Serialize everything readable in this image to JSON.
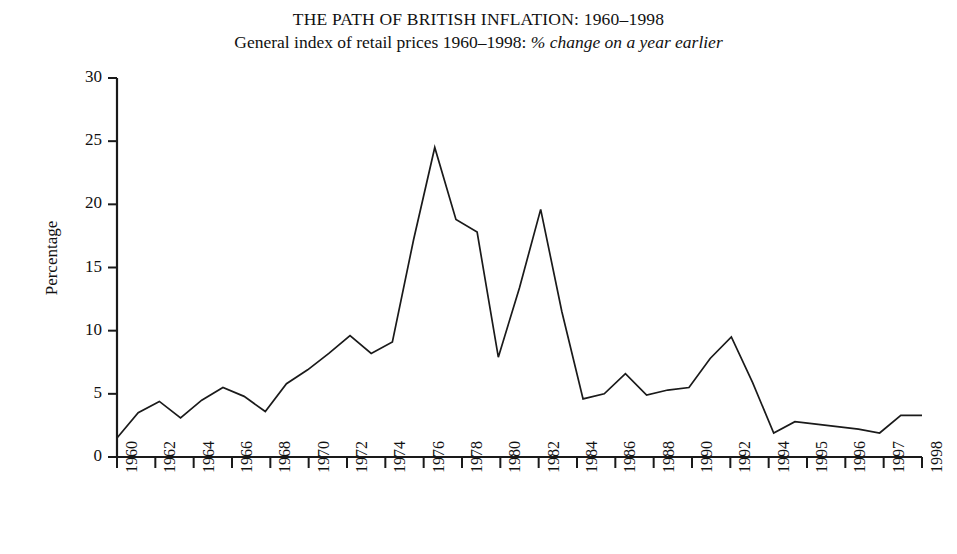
{
  "chart_data": {
    "type": "line",
    "title": "THE PATH OF BRITISH INFLATION: 1960–1998",
    "subtitle_plain": "General index of retail prices 1960–1998: ",
    "subtitle_italic": "% change on a year earlier",
    "xlabel": "",
    "ylabel": "Percentage",
    "ylim": [
      0,
      30
    ],
    "yticks": [
      0,
      5,
      10,
      15,
      20,
      25,
      30
    ],
    "ytick_labels": [
      "0",
      "5",
      "10",
      "15",
      "20",
      "25",
      "30"
    ],
    "xlim": [
      1960,
      1998
    ],
    "xtick_labels": [
      "1960",
      "1962",
      "1964",
      "1966",
      "1968",
      "1970",
      "1972",
      "1974",
      "1976",
      "1978",
      "1980",
      "1982",
      "1984",
      "1986",
      "1988",
      "1990",
      "1992",
      "1994",
      "1995",
      "1996",
      "1997",
      "1998"
    ],
    "grid": false,
    "legend": "none",
    "line_color": "#1a1a1a",
    "line_width": 1.6,
    "x": [
      1960,
      1961,
      1962,
      1963,
      1964,
      1965,
      1966,
      1967,
      1968,
      1969,
      1970,
      1971,
      1972,
      1973,
      1974,
      1975,
      1976,
      1977,
      1978,
      1979,
      1980,
      1981,
      1982,
      1983,
      1984,
      1985,
      1986,
      1987,
      1988,
      1989,
      1990,
      1991,
      1992,
      1993,
      1994,
      1995,
      1996,
      1997,
      1998
    ],
    "values": [
      1.5,
      3.5,
      4.4,
      3.1,
      4.5,
      5.5,
      4.8,
      3.6,
      5.8,
      6.9,
      8.2,
      9.6,
      8.2,
      9.1,
      17.2,
      24.5,
      18.8,
      17.8,
      7.9,
      13.4,
      19.6,
      11.5,
      4.6,
      5.0,
      6.6,
      4.9,
      5.3,
      5.5,
      7.8,
      9.5,
      5.9,
      1.9,
      2.8,
      2.6,
      2.4,
      2.2,
      1.9,
      3.3,
      3.3
    ]
  },
  "axes": {
    "y_axis_name": "y-axis",
    "x_axis_name": "x-axis"
  }
}
